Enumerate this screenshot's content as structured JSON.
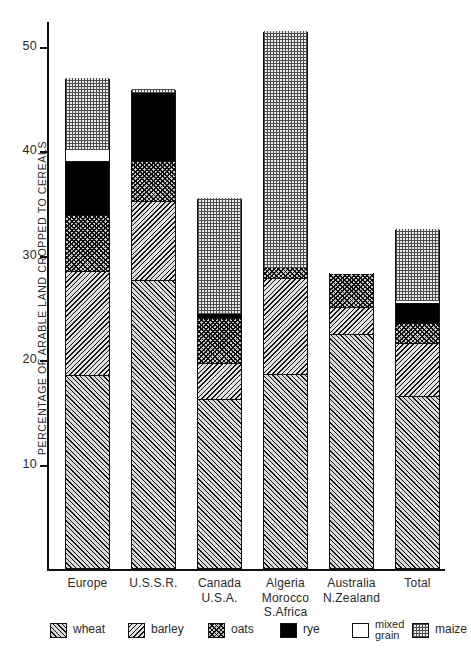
{
  "chart_data": {
    "type": "bar",
    "subtype": "stacked-bar",
    "title": "",
    "xlabel": "",
    "ylabel": "PERCENTAGE OF ARABLE LAND CROPPED TO CEREALS",
    "ylim": [
      0,
      52.5
    ],
    "yticks": [
      10,
      20,
      30,
      40,
      50
    ],
    "ytick_labels": [
      "10",
      "20",
      "30",
      "40",
      "50"
    ],
    "grid": false,
    "legend_position": "bottom",
    "categories": [
      "Europe",
      "U.S.S.R.",
      "Canada\nU.S.A.",
      "Algeria\nMorocco\nS.Africa",
      "Australia\nN.Zealand",
      "Total"
    ],
    "category_lines": [
      [
        "Europe"
      ],
      [
        "U.S.S.R."
      ],
      [
        "Canada",
        "U.S.A."
      ],
      [
        "Algeria",
        "Morocco",
        "S.Africa"
      ],
      [
        "Australia",
        "N.Zealand"
      ],
      [
        "Total"
      ]
    ],
    "series": [
      {
        "name": "wheat",
        "values": [
          18.5,
          27.6,
          16.2,
          18.6,
          22.4,
          16.5
        ]
      },
      {
        "name": "barley",
        "values": [
          10.0,
          7.6,
          3.4,
          9.2,
          2.6,
          5.1
        ]
      },
      {
        "name": "oats",
        "values": [
          5.3,
          3.8,
          4.4,
          1.0,
          3.3,
          1.9
        ]
      },
      {
        "name": "rye",
        "values": [
          5.2,
          6.6,
          0.4,
          0.0,
          0.0,
          1.9
        ]
      },
      {
        "name": "mixed grain",
        "values": [
          1.1,
          0.0,
          0.0,
          0.0,
          0.2,
          0.3
        ]
      },
      {
        "name": "maize",
        "values": [
          6.9,
          0.4,
          11.1,
          22.7,
          0.0,
          6.9
        ]
      }
    ],
    "totals": [
      47.0,
      46.0,
      35.5,
      51.5,
      28.5,
      32.6
    ],
    "legend_entries": [
      {
        "name": "wheat",
        "label": "wheat",
        "label_lines": [
          "wheat"
        ],
        "pattern": "diagonal-hatch-right"
      },
      {
        "name": "barley",
        "label": "barley",
        "label_lines": [
          "barley"
        ],
        "pattern": "diagonal-hatch-left"
      },
      {
        "name": "oats",
        "label": "oats",
        "label_lines": [
          "oats"
        ],
        "pattern": "cross-hatch"
      },
      {
        "name": "rye",
        "label": "rye",
        "label_lines": [
          "rye"
        ],
        "pattern": "solid-black"
      },
      {
        "name": "mixed grain",
        "label": "mixed grain",
        "label_lines": [
          "mixed",
          "grain"
        ],
        "pattern": "white"
      },
      {
        "name": "maize",
        "label": "maize",
        "label_lines": [
          "maize"
        ],
        "pattern": "fine-stipple"
      }
    ]
  }
}
